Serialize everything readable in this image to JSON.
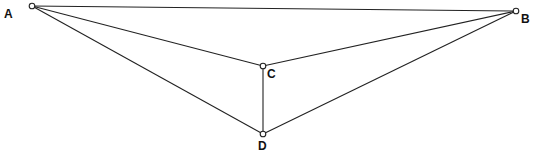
{
  "diagram": {
    "type": "geometric-figure",
    "points": [
      {
        "id": "A",
        "label": "A",
        "x": 32,
        "y": 6,
        "label_x": 4,
        "label_y": 18
      },
      {
        "id": "B",
        "label": "B",
        "x": 516,
        "y": 11,
        "label_x": 521,
        "label_y": 23
      },
      {
        "id": "C",
        "label": "C",
        "x": 263,
        "y": 66,
        "label_x": 267,
        "label_y": 78
      },
      {
        "id": "D",
        "label": "D",
        "x": 263,
        "y": 134,
        "label_x": 258,
        "label_y": 150
      }
    ],
    "segments": [
      [
        "A",
        "B"
      ],
      [
        "A",
        "C"
      ],
      [
        "A",
        "D"
      ],
      [
        "B",
        "C"
      ],
      [
        "B",
        "D"
      ],
      [
        "C",
        "D"
      ]
    ]
  }
}
